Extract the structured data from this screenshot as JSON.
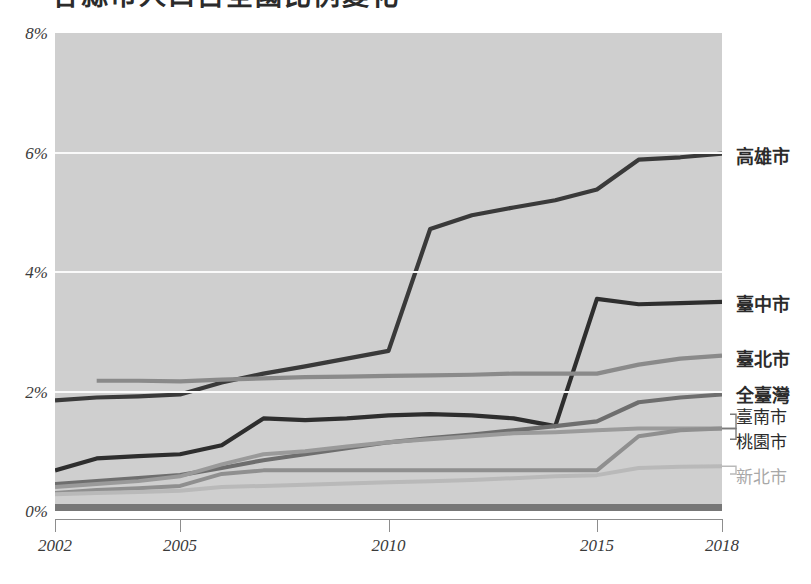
{
  "title": {
    "text": "各縣市人口占全國比例變化",
    "clipped": true
  },
  "chart_data": {
    "type": "line",
    "title": "",
    "xlabel": "",
    "ylabel": "",
    "xlim": [
      2002,
      2018
    ],
    "ylim": [
      0,
      8
    ],
    "grid": true,
    "legend_position": "right-inline-labels",
    "y_tick_labels": [
      "0%",
      "2%",
      "4%",
      "6%",
      "8%"
    ],
    "y_ticks": [
      0,
      2,
      4,
      6,
      8
    ],
    "x_tick_labels": [
      "2002",
      "2005",
      "2010",
      "2015",
      "2018"
    ],
    "x_ticks": [
      2002,
      2005,
      2010,
      2015,
      2018
    ],
    "x": [
      2002,
      2003,
      2004,
      2005,
      2006,
      2007,
      2008,
      2009,
      2010,
      2011,
      2012,
      2013,
      2014,
      2015,
      2016,
      2017,
      2018
    ],
    "series": [
      {
        "name": "高雄市",
        "color": "#3a3a3a",
        "width": 4.2,
        "label_y_pct": 6.0,
        "values": [
          1.85,
          1.9,
          1.92,
          1.95,
          2.15,
          2.3,
          2.42,
          2.55,
          2.68,
          4.72,
          4.95,
          5.08,
          5.2,
          5.38,
          5.88,
          5.92,
          5.98
        ]
      },
      {
        "name": "臺中市",
        "color": "#2e2e2e",
        "width": 4.2,
        "label_y_pct": 3.52,
        "values": [
          0.68,
          0.88,
          0.92,
          0.95,
          1.1,
          1.55,
          1.52,
          1.55,
          1.6,
          1.62,
          1.6,
          1.55,
          1.42,
          3.55,
          3.46,
          3.48,
          3.5
        ]
      },
      {
        "name": "臺北市",
        "color": "#8a8a8a",
        "width": 4.2,
        "label_y_pct": 2.6,
        "values": [
          null,
          2.18,
          2.18,
          2.17,
          2.2,
          2.22,
          2.24,
          2.25,
          2.26,
          2.27,
          2.28,
          2.3,
          2.3,
          2.3,
          2.45,
          2.55,
          2.6
        ]
      },
      {
        "name": "全臺灣",
        "color": "#6e6e6e",
        "width": 4.2,
        "label_y_pct": 2.0,
        "values": [
          0.45,
          0.5,
          0.55,
          0.6,
          0.72,
          0.85,
          0.95,
          1.05,
          1.15,
          1.22,
          1.28,
          1.35,
          1.42,
          1.5,
          1.82,
          1.9,
          1.95
        ]
      },
      {
        "name": "臺南市",
        "color": "#9a9a9a",
        "width": 4.0,
        "label_y_pct": 1.62,
        "values": [
          0.4,
          0.45,
          0.5,
          0.58,
          0.78,
          0.95,
          1.0,
          1.08,
          1.15,
          1.2,
          1.25,
          1.3,
          1.32,
          1.35,
          1.38,
          1.38,
          1.38
        ]
      },
      {
        "name": "桃園市",
        "color": "#8f8f8f",
        "width": 4.0,
        "label_y_pct": 1.2,
        "values": [
          0.3,
          0.35,
          0.38,
          0.42,
          0.62,
          0.68,
          0.68,
          0.68,
          0.68,
          0.68,
          0.68,
          0.68,
          0.68,
          0.68,
          1.25,
          1.35,
          1.38
        ]
      },
      {
        "name": "新北市",
        "color": "#b9b9b9",
        "width": 4.0,
        "label_y_pct": 0.62,
        "values": [
          0.28,
          0.3,
          0.32,
          0.34,
          0.4,
          0.42,
          0.44,
          0.46,
          0.48,
          0.5,
          0.52,
          0.55,
          0.58,
          0.6,
          0.72,
          0.74,
          0.75
        ]
      },
      {
        "name": "baseline-band",
        "color": "#777777",
        "width": 9.0,
        "label_y_pct": null,
        "values": [
          0.04,
          0.04,
          0.04,
          0.04,
          0.04,
          0.04,
          0.04,
          0.04,
          0.04,
          0.04,
          0.04,
          0.04,
          0.04,
          0.04,
          0.04,
          0.04,
          0.04
        ]
      }
    ]
  },
  "colors": {
    "plot_background": "#cfcfcf",
    "gridline": "#fafafa",
    "axis": "#8d8d8d",
    "text": "#3a3a3a"
  }
}
